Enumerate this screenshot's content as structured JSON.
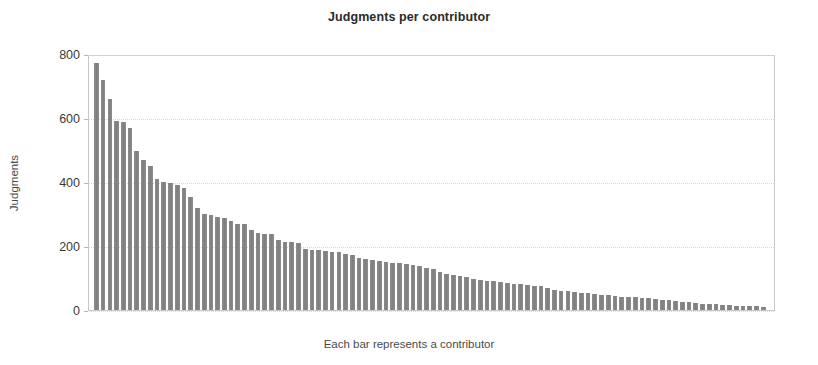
{
  "chart_data": {
    "type": "bar",
    "title": "Judgments per contributor",
    "xlabel": "Each bar represents a contributor",
    "ylabel": "Judgments",
    "ylim": [
      0,
      800
    ],
    "yticks": [
      0,
      200,
      400,
      600,
      800
    ],
    "ytick_labels": [
      "0",
      "200",
      "400",
      "600",
      "800"
    ],
    "grid": true,
    "legend": "none",
    "bar_color": "#878787",
    "categories_note": "100 anonymous contributors, sorted descending; no x tick labels shown",
    "n_bars": 100,
    "values": [
      772,
      718,
      660,
      592,
      588,
      570,
      498,
      470,
      450,
      408,
      400,
      398,
      392,
      380,
      352,
      318,
      300,
      296,
      292,
      286,
      278,
      270,
      268,
      250,
      242,
      238,
      236,
      218,
      214,
      212,
      208,
      190,
      188,
      186,
      184,
      182,
      180,
      176,
      172,
      164,
      160,
      156,
      152,
      150,
      148,
      146,
      144,
      140,
      136,
      132,
      128,
      120,
      114,
      110,
      106,
      102,
      98,
      94,
      92,
      90,
      86,
      84,
      82,
      80,
      78,
      76,
      74,
      70,
      62,
      60,
      58,
      56,
      54,
      52,
      50,
      48,
      46,
      44,
      42,
      40,
      40,
      38,
      36,
      34,
      32,
      30,
      28,
      26,
      24,
      22,
      20,
      20,
      18,
      16,
      16,
      14,
      14,
      12,
      12,
      10
    ]
  },
  "chart": {
    "title": "Judgments per contributor",
    "y_axis_title": "Judgments",
    "x_axis_title": "Each bar represents a contributor"
  }
}
